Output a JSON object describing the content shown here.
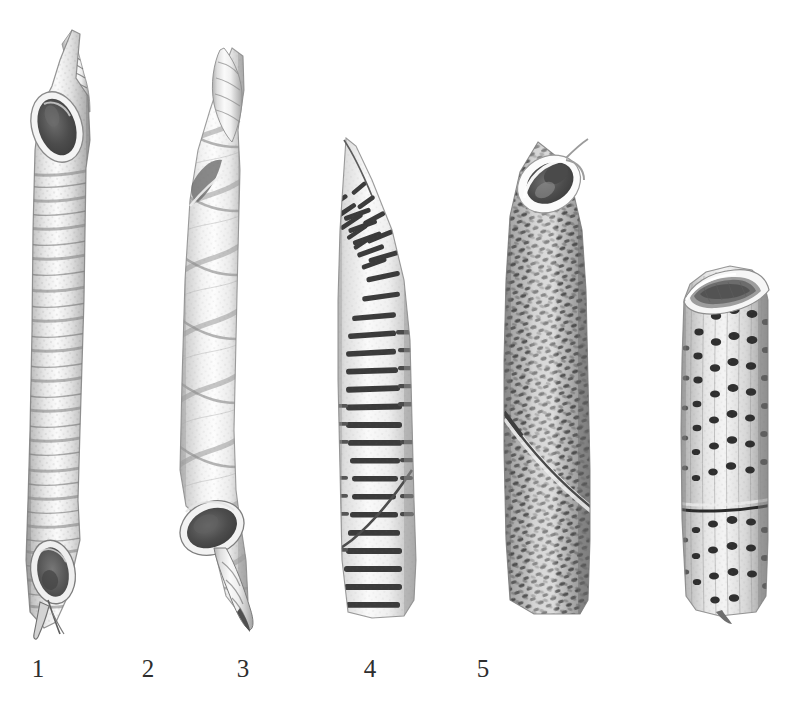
{
  "plate": {
    "kind": "scientific-illustration-plate",
    "description": "Grayscale plate of five tubular agglutinated specimens drawn side by side on a white field, each numbered beneath.",
    "background_color": "#ffffff",
    "ink_color": "#2e2e2e",
    "width": 812,
    "height": 717
  },
  "figures": [
    {
      "id": "specimen-1",
      "label": "1",
      "label_x": 36,
      "label_y": 662,
      "center_x": 55,
      "top": 28,
      "bottom": 637,
      "width": 62,
      "surface": "smooth annulated tube with close-set transverse growth rings",
      "apertures": "open at both ends, oblique oval aperture at top and at base",
      "tail": "short curved pointed spur at lower end",
      "tone": "pale grey with darker banding"
    },
    {
      "id": "specimen-2",
      "label": "2",
      "label_x": 146,
      "label_y": 662,
      "center_x": 210,
      "top": 46,
      "bottom": 628,
      "width": 62,
      "surface": "smooth tube with broad helical spiral bands",
      "apertures": "narrow tapering apex above, wide oval aperture below",
      "tail": "slender bent spine projecting from base",
      "tone": "very pale grey, light spiral shading"
    },
    {
      "id": "specimen-3",
      "label": "3",
      "label_x": 241,
      "label_y": 662,
      "center_x": 372,
      "top": 136,
      "bottom": 620,
      "width": 72,
      "surface": "tube ornamented with rows of short dark transverse dashes in oblique series",
      "apertures": "pointed tapering apex, truncate base",
      "tail": "none",
      "tone": "white ground with strong black dashes"
    },
    {
      "id": "specimen-4",
      "label": "4",
      "label_x": 368,
      "label_y": 662,
      "center_x": 545,
      "top": 140,
      "bottom": 618,
      "width": 80,
      "surface": "dense reticulate mesh of small dark granules in crossing diagonal rows",
      "apertures": "large oblique oval aperture at the summit with raised pale rim",
      "tail": "none",
      "tone": "medium grey, heavily stippled"
    },
    {
      "id": "specimen-5",
      "label": "5",
      "label_x": 481,
      "label_y": 662,
      "center_x": 722,
      "top": 266,
      "bottom": 620,
      "width": 88,
      "surface": "tube with longitudinal rows of coarse round punctae, divided by a sharp transverse suture",
      "apertures": "obliquely truncated open end above showing the interior wall",
      "tail": "none",
      "tone": "pale grey with black pores"
    }
  ],
  "corner_marks": {
    "present": true,
    "note": "faint residual printing specks at upper-left margin"
  }
}
